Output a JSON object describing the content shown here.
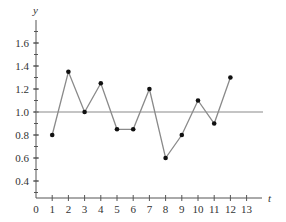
{
  "chart_data": {
    "type": "line",
    "title": "",
    "xlabel": "t",
    "ylabel": "y",
    "x": [
      1,
      2,
      3,
      4,
      5,
      6,
      7,
      8,
      9,
      10,
      11,
      12
    ],
    "series": [
      {
        "name": "y",
        "values": [
          0.8,
          1.35,
          1.0,
          1.25,
          0.85,
          0.85,
          1.2,
          0.6,
          0.8,
          1.1,
          0.9,
          1.3
        ]
      }
    ],
    "reference_line": {
      "y": 1.0
    },
    "x_ticks": [
      "0",
      "1",
      "2",
      "3",
      "4",
      "5",
      "6",
      "7",
      "8",
      "9",
      "10",
      "11",
      "12",
      "13"
    ],
    "y_ticks": [
      "0.4",
      "0.6",
      "0.8",
      "1.0",
      "1.2",
      "1.4",
      "1.6"
    ],
    "xlim": [
      0,
      14
    ],
    "ylim": [
      0.25,
      1.8
    ],
    "grid": false,
    "legend": "none",
    "colors": {
      "line": "#8a8a8a",
      "points": "#111111",
      "axis": "#555555",
      "reference": "#8a8a8a"
    }
  }
}
